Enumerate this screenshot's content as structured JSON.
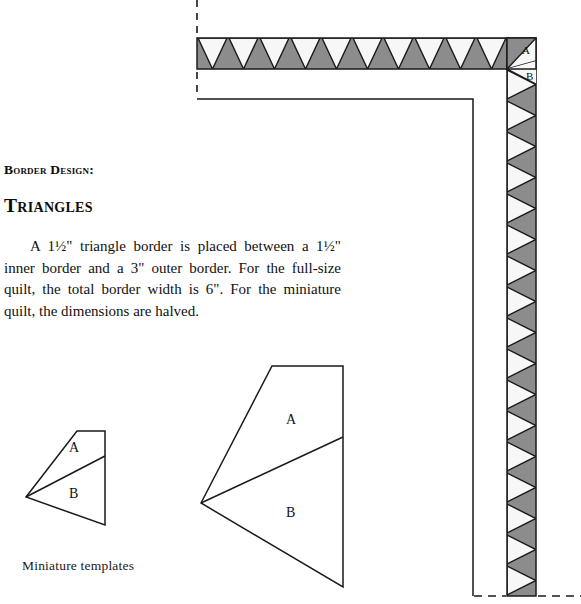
{
  "document": {
    "kind": "quilting-pattern-page",
    "heading_small": "Border Design:",
    "heading_large": "Triangles",
    "paragraph": "A 1½\" triangle border is placed between a 1½\" inner border and a 3\" outer border. For the full-size quilt, the total border width is 6\". For the miniature quilt, the dimensions are halved.",
    "caption": "Miniature templates"
  },
  "colors": {
    "triangle_fill": "#8c8c8c",
    "triangle_white": "#f7f7f7",
    "stroke": "#1a1a1a",
    "page_background": "#ffffff",
    "text": "#111111"
  },
  "border_diagram": {
    "name": "quilt-corner-border-diagram",
    "top_strip": {
      "x": 197,
      "y": 38,
      "width": 311,
      "height": 31,
      "white_triangle_count": 10,
      "orientation": "points-down",
      "pitch": 31
    },
    "right_strip": {
      "x": 507,
      "y": 38,
      "width": 29,
      "height": 558,
      "white_triangle_count": 17,
      "orientation": "points-right",
      "pitch": 31
    },
    "corner_labels": [
      {
        "text": "A",
        "x": 526,
        "y": 52
      },
      {
        "text": "B",
        "x": 530,
        "y": 77
      }
    ],
    "inner_border_line": {
      "points": "197,99 473,99 473,596",
      "description": "inner border outline"
    },
    "dashed_guides": [
      {
        "name": "top-left-vertical-dash",
        "x1": 197,
        "y1": 0,
        "x2": 197,
        "y2": 36
      },
      {
        "name": "left-lower-vertical-dash",
        "x1": 197,
        "y1": 72,
        "x2": 197,
        "y2": 97
      },
      {
        "name": "bottom-left-dash",
        "x1": 475,
        "y1": 596,
        "x2": 505,
        "y2": 596
      },
      {
        "name": "bottom-right-dash",
        "x1": 538,
        "y1": 596,
        "x2": 581,
        "y2": 596
      }
    ]
  },
  "templates": {
    "miniature": {
      "name": "miniature-template-shape",
      "outline": "26,497 77,431 105,431 105,525",
      "divider": "26,497 105,456",
      "labels": [
        {
          "text": "A",
          "x": 74,
          "y": 452
        },
        {
          "text": "B",
          "x": 74,
          "y": 497
        }
      ]
    },
    "full_size": {
      "name": "full-size-template-shape",
      "outline": "201,503 272,366 343,366 343,587",
      "divider": "201,503 343,437",
      "labels": [
        {
          "text": "A",
          "x": 291,
          "y": 424
        },
        {
          "text": "B",
          "x": 291,
          "y": 517
        }
      ]
    }
  }
}
